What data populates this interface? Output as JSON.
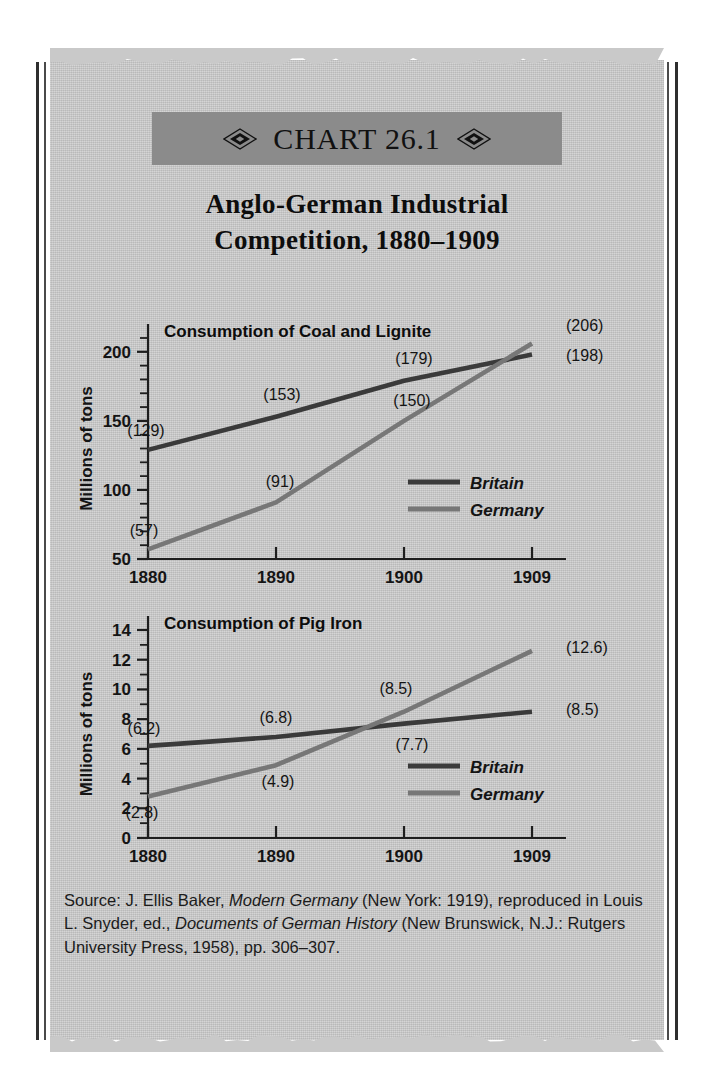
{
  "banner": {
    "label": "CHART 26.1",
    "left_ornament": "diamond-ornament",
    "right_ornament": "diamond-ornament",
    "background_color": "#8b8b8b"
  },
  "title": {
    "line1": "Anglo-German Industrial",
    "line2": "Competition, 1880–1909"
  },
  "colors": {
    "britain_line": "#3a3a3a",
    "germany_line": "#777777",
    "paper": "#c9c9c9",
    "rule": "#2e2e2e",
    "text": "#141414"
  },
  "source": {
    "prefix": "Source: J. Ellis Baker, ",
    "italic1": "Modern Germany",
    "mid1": " (New York: 1919), reproduced in Louis L. Snyder, ed., ",
    "italic2": "Documents of German History",
    "mid2": " (New Brunswick, N.J.: Rutgers University Press, 1958), pp. 306–307."
  },
  "legend": {
    "britain": "Britain",
    "germany": "Germany"
  },
  "chart_data": [
    {
      "type": "line",
      "id": "coal",
      "title": "Consumption of Coal and Lignite",
      "xlabel": "",
      "ylabel": "Millions of tons",
      "categories": [
        "1880",
        "1890",
        "1900",
        "1909"
      ],
      "x": [
        1880,
        1890,
        1900,
        1909
      ],
      "ylim": [
        50,
        210
      ],
      "yticks": [
        50,
        100,
        150,
        200
      ],
      "ytick_labels": [
        "50",
        "100",
        "150",
        "200"
      ],
      "yminor_step": 10,
      "grid": false,
      "legend_position": "lower-right",
      "series": [
        {
          "name": "Britain",
          "color": "#3a3a3a",
          "values": [
            129,
            153,
            179,
            198
          ],
          "labels": [
            "(129)",
            "(153)",
            "(179)",
            "(198)"
          ]
        },
        {
          "name": "Germany",
          "color": "#777777",
          "values": [
            57,
            91,
            150,
            206
          ],
          "labels": [
            "(57)",
            "(91)",
            "(150)",
            "(206)"
          ]
        }
      ]
    },
    {
      "type": "line",
      "id": "iron",
      "title": "Consumption of Pig Iron",
      "xlabel": "",
      "ylabel": "Millions of tons",
      "categories": [
        "1880",
        "1890",
        "1900",
        "1909"
      ],
      "x": [
        1880,
        1890,
        1900,
        1909
      ],
      "ylim": [
        0,
        14
      ],
      "yticks": [
        0,
        2,
        4,
        6,
        8,
        10,
        12,
        14
      ],
      "ytick_labels": [
        "0",
        "2",
        "4",
        "6",
        "8",
        "10",
        "12",
        "14"
      ],
      "yminor_step": 1,
      "grid": false,
      "legend_position": "lower-right",
      "series": [
        {
          "name": "Britain",
          "color": "#3a3a3a",
          "values": [
            6.2,
            6.8,
            7.7,
            8.5
          ],
          "labels": [
            "(6.2)",
            "(6.8)",
            "(7.7)",
            "(8.5)"
          ]
        },
        {
          "name": "Germany",
          "color": "#777777",
          "values": [
            2.8,
            4.9,
            8.5,
            12.6
          ],
          "labels": [
            "(2.8)",
            "(4.9)",
            "(8.5)",
            "(12.6)"
          ]
        }
      ]
    }
  ]
}
